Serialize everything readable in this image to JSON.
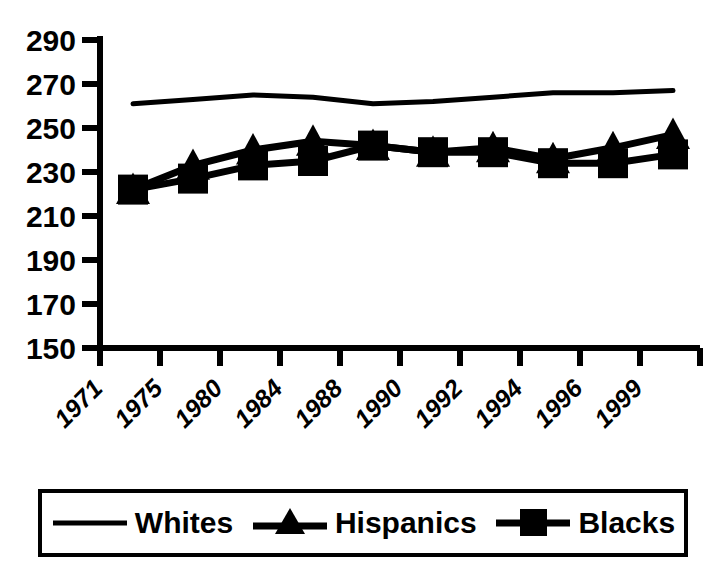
{
  "chart_data": {
    "type": "line",
    "title": "",
    "subtitle": "",
    "xlabel": "",
    "ylabel": "",
    "x": [
      "1971",
      "1975",
      "1980",
      "1984",
      "1988",
      "1990",
      "1992",
      "1994",
      "1996",
      "1999"
    ],
    "categories": [
      "1971",
      "1975",
      "1980",
      "1984",
      "1988",
      "1990",
      "1992",
      "1994",
      "1996",
      "1999"
    ],
    "ylim": [
      150,
      290
    ],
    "yticks": [
      150,
      170,
      190,
      210,
      230,
      250,
      270,
      290
    ],
    "grid": false,
    "legend_position": "bottom",
    "series": [
      {
        "name": "Whites",
        "marker": "none",
        "color": "#000000",
        "values": [
          261,
          263,
          265,
          264,
          261,
          262,
          264,
          266,
          266,
          267
        ]
      },
      {
        "name": "Hispanics",
        "marker": "triangle",
        "color": "#000000",
        "values": [
          222,
          233,
          240,
          244,
          242,
          239,
          241,
          236,
          241,
          247
        ]
      },
      {
        "name": "Blacks",
        "marker": "square",
        "color": "#000000",
        "values": [
          222,
          227,
          233,
          235,
          242,
          239,
          239,
          234,
          234,
          238
        ]
      }
    ]
  },
  "axes": {
    "y_tick_labels": [
      "290",
      "270",
      "250",
      "230",
      "210",
      "190",
      "170",
      "150"
    ],
    "x_tick_labels": [
      "1971",
      "1975",
      "1980",
      "1984",
      "1988",
      "1990",
      "1992",
      "1994",
      "1996",
      "1999"
    ]
  },
  "legend": {
    "items": [
      {
        "label": "Whites",
        "marker": "line-swatch-icon"
      },
      {
        "label": "Hispanics",
        "marker": "triangle-marker-icon"
      },
      {
        "label": "Blacks",
        "marker": "square-marker-icon"
      }
    ]
  },
  "colors": {
    "foreground": "#000000",
    "background": "#ffffff"
  }
}
